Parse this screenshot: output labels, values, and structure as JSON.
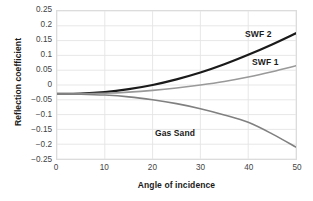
{
  "chart_data": {
    "type": "line",
    "title": "",
    "xlabel": "Angle of incidence",
    "ylabel": "Reflection coefficient",
    "xlim": [
      0,
      50
    ],
    "ylim": [
      -0.25,
      0.25
    ],
    "xticks": [
      0,
      10,
      20,
      30,
      40,
      50
    ],
    "xtick_labels": [
      "0",
      "10",
      "20",
      "30",
      "40",
      "50"
    ],
    "yticks": [
      0.25,
      0.2,
      0.15,
      0.1,
      0.05,
      0,
      -0.05,
      -0.1,
      -0.15,
      -0.2,
      -0.25
    ],
    "ytick_labels": [
      "0.25",
      "0.2",
      "0.15",
      "0.1",
      "0.05",
      "0",
      "−0.05",
      "−0.1",
      "−0.15",
      "−0.2",
      "−0.25"
    ],
    "grid": true,
    "legend_position": "inline-annotations",
    "x": [
      0,
      5,
      10,
      15,
      20,
      25,
      30,
      35,
      40,
      45,
      50
    ],
    "series": [
      {
        "name": "SWF 2",
        "color": "#1a1a1a",
        "width": 2.2,
        "label_text": "SWF 2",
        "values": [
          -0.03,
          -0.029,
          -0.024,
          -0.014,
          0.0,
          0.019,
          0.042,
          0.07,
          0.102,
          0.137,
          0.175
        ]
      },
      {
        "name": "SWF 1",
        "color": "#999999",
        "width": 1.6,
        "label_text": "SWF 1",
        "values": [
          -0.03,
          -0.03,
          -0.028,
          -0.024,
          -0.018,
          -0.01,
          0.0,
          0.012,
          0.027,
          0.045,
          0.065
        ]
      },
      {
        "name": "Gas Sand",
        "color": "#808080",
        "width": 1.6,
        "label_text": "Gas Sand",
        "values": [
          -0.03,
          -0.031,
          -0.034,
          -0.04,
          -0.05,
          -0.063,
          -0.08,
          -0.101,
          -0.126,
          -0.165,
          -0.21
        ]
      }
    ],
    "annotations": [
      {
        "text": "SWF 2",
        "x_px": 245,
        "y_px": 29
      },
      {
        "text": "SWF 1",
        "x_px": 252,
        "y_px": 57
      },
      {
        "text": "Gas Sand",
        "x_px": 155,
        "y_px": 128
      }
    ]
  },
  "axis": {
    "xlabel": "Angle of incidence",
    "ylabel": "Reflection coefficient"
  }
}
